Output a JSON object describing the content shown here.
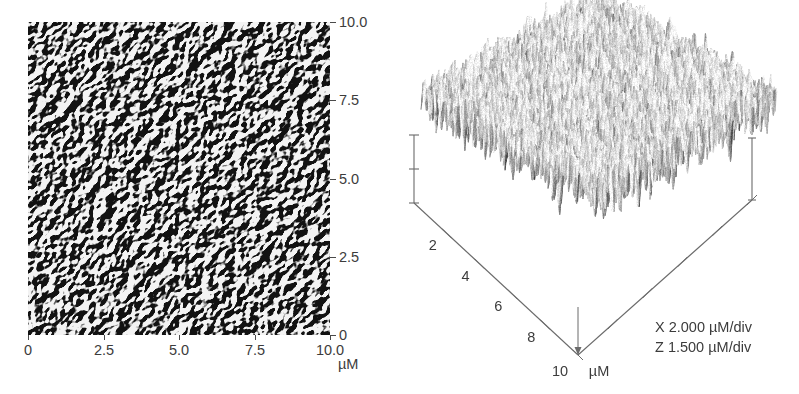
{
  "figure": {
    "type": "afm-micrograph-pair",
    "background_color": "#ffffff",
    "text_color": "#3c3c3c",
    "axis_color": "#4a4a4a"
  },
  "panel_2d": {
    "name": "2D AFM topography map",
    "unit_label": "µM",
    "x_axis": {
      "ticks": [
        "0",
        "2.5",
        "5.0",
        "7.5",
        "10.0"
      ],
      "values": [
        0,
        2.5,
        5.0,
        7.5,
        10.0
      ],
      "range": [
        0,
        10
      ]
    },
    "y_axis": {
      "ticks": [
        "0",
        "2.5",
        "5.0",
        "7.5",
        "10.0"
      ],
      "values": [
        0,
        2.5,
        5.0,
        7.5,
        10.0
      ],
      "range": [
        0,
        10
      ]
    }
  },
  "panel_3d": {
    "name": "3D AFM surface rendering",
    "unit_label": "µM",
    "bottom_left_axis": {
      "ticks": [
        "2",
        "4",
        "6",
        "8",
        "10"
      ],
      "values": [
        2,
        4,
        6,
        8,
        10
      ]
    },
    "corner_label": "10",
    "corner_unit": "µM",
    "legend": [
      "X 2.000 µM/div",
      "Z 1.500 µM/div"
    ],
    "x_scale": "2.000",
    "z_scale": "1.500",
    "scale_unit": "µM/div"
  },
  "chart_data": {
    "type": "heatmap",
    "title": "",
    "xlabel": "µM",
    "ylabel": "µM",
    "xlim": [
      0,
      10
    ],
    "ylim": [
      0,
      10
    ],
    "xticks": [
      0,
      2.5,
      5.0,
      7.5,
      10.0
    ],
    "yticks": [
      0,
      2.5,
      5.0,
      7.5,
      10.0
    ],
    "xticklabels": [
      "0",
      "2.5",
      "5.0",
      "7.5",
      "10.0"
    ],
    "yticklabels": [
      "0",
      "2.5",
      "5.0",
      "7.5",
      "10.0"
    ],
    "grid": false,
    "legend": "none",
    "colormap": "grayscale",
    "panels": [
      {
        "index": 0,
        "render": "2d-deflection-map",
        "scan_size_um": 10,
        "description": "Grayscale 10x10 micrometre atomic force microscopy deflection image showing dense globular surface grains"
      },
      {
        "index": 1,
        "render": "3d-surface-plot",
        "scan_size_um": 10,
        "x_per_div_um": 2.0,
        "z_per_div_um": 1.5,
        "axis_ticks_um": [
          2,
          4,
          6,
          8,
          10
        ],
        "description": "Isometric 3D height rendering of the same 10x10 micrometre scan with nodular peaks"
      }
    ]
  }
}
